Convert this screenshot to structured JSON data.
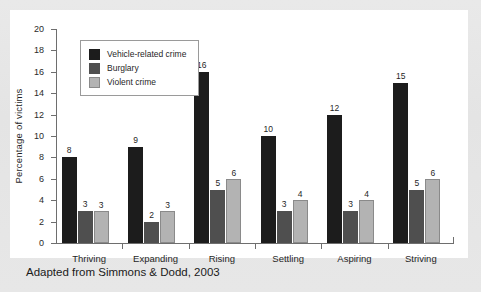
{
  "caption": "Adapted from Simmons & Dodd, 2003",
  "legend": {
    "position": "top-left",
    "entries": [
      {
        "label": "Vehicle-related crime",
        "color": "#1c1c1c"
      },
      {
        "label": "Burglary",
        "color": "#4f4f4f"
      },
      {
        "label": "Violent crime",
        "color": "#b3b3b3"
      }
    ]
  },
  "chart_data": {
    "type": "bar",
    "title": "",
    "xlabel": "",
    "ylabel": "Percentage of victims",
    "ylim": [
      0,
      20
    ],
    "ytick_step": 2,
    "yticks": [
      "20",
      "18",
      "16",
      "14",
      "12",
      "10",
      "8",
      "6",
      "4",
      "2",
      "0"
    ],
    "grid": false,
    "categories": [
      "Thriving",
      "Expanding",
      "Rising",
      "Settling",
      "Aspiring",
      "Striving"
    ],
    "series": [
      {
        "name": "Vehicle-related crime",
        "color": "#1c1c1c",
        "values": [
          8,
          9,
          16,
          10,
          12,
          15
        ]
      },
      {
        "name": "Burglary",
        "color": "#4f4f4f",
        "values": [
          3,
          2,
          5,
          3,
          3,
          5
        ]
      },
      {
        "name": "Violent crime",
        "color": "#b3b3b3",
        "values": [
          3,
          3,
          6,
          4,
          4,
          6
        ]
      }
    ]
  }
}
